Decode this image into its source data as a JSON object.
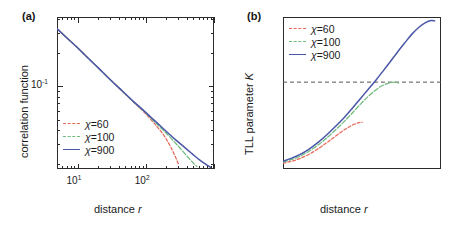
{
  "figure": {
    "panels": [
      {
        "letter": "(a)",
        "xlabel_prefix": "distance ",
        "xlabel_var": "r",
        "ylabel": "correlation function",
        "x_ticklabels": [
          {
            "mantissa": "10",
            "exponent": "1",
            "xval": 10
          },
          {
            "mantissa": "10",
            "exponent": "2",
            "xval": 100
          }
        ],
        "y_ticklabels": [
          {
            "mantissa": "10",
            "exponent": "-1",
            "yval": 0.1
          }
        ],
        "legend": [
          {
            "label_prefix": "χ",
            "label_rest": "=60",
            "color": "#e8685a",
            "dash": "3,2.2"
          },
          {
            "label_prefix": "χ",
            "label_rest": "=100",
            "color": "#6fba7d",
            "dash": "5,2.2"
          },
          {
            "label_prefix": "χ",
            "label_rest": "=900",
            "color": "#4a56a8",
            "dash": "none"
          }
        ]
      },
      {
        "letter": "(b)",
        "xlabel_prefix": "distance ",
        "xlabel_var": "r",
        "ylabel_prefix": "TLL parameter ",
        "ylabel_var": "K",
        "x_ticklabels": [
          {
            "mantissa": "10",
            "exponent": "1",
            "xval": 10
          },
          {
            "mantissa": "10",
            "exponent": "2",
            "xval": 100
          }
        ],
        "y_ticklabels": [
          {
            "text": "1.8",
            "yval": 1.8
          },
          {
            "text": "1.9",
            "yval": 1.9
          },
          {
            "text": "2.0",
            "yval": 2.0
          },
          {
            "text": "2.1",
            "yval": 2.1
          }
        ],
        "reference_line": {
          "value": 2.0,
          "color": "#555555",
          "dash": "4,3"
        },
        "legend": [
          {
            "label_prefix": "χ",
            "label_rest": "=60",
            "color": "#e8685a",
            "dash": "3,2.2"
          },
          {
            "label_prefix": "χ",
            "label_rest": "=100",
            "color": "#6fba7d",
            "dash": "5,2.2"
          },
          {
            "label_prefix": "χ",
            "label_rest": "=900",
            "color": "#4a56a8",
            "dash": "none"
          }
        ]
      }
    ]
  },
  "chart_data": [
    {
      "id": "panel-a",
      "type": "line",
      "title": "(a)",
      "xlabel": "distance r",
      "ylabel": "correlation function",
      "xscale": "log",
      "yscale": "log",
      "xlim": [
        5,
        1000
      ],
      "ylim": [
        0.018,
        0.42
      ],
      "grid": false,
      "legend_position": "lower-left",
      "series": [
        {
          "name": "χ=60",
          "color": "#e8685a",
          "style": "dashed",
          "x": [
            5,
            7,
            10,
            15,
            20,
            30,
            45,
            65,
            90,
            120,
            150,
            185,
            220,
            260,
            300
          ],
          "y": [
            0.33,
            0.272,
            0.222,
            0.174,
            0.147,
            0.115,
            0.0906,
            0.0727,
            0.0603,
            0.0498,
            0.0425,
            0.036,
            0.0302,
            0.0246,
            0.02
          ]
        },
        {
          "name": "χ=100",
          "color": "#6fba7d",
          "style": "dashed",
          "x": [
            5,
            7,
            10,
            15,
            20,
            30,
            45,
            65,
            90,
            120,
            160,
            210,
            270,
            340,
            420,
            500,
            560
          ],
          "y": [
            0.33,
            0.272,
            0.222,
            0.174,
            0.147,
            0.115,
            0.0908,
            0.0731,
            0.061,
            0.0514,
            0.0432,
            0.0366,
            0.031,
            0.0265,
            0.0228,
            0.0203,
            0.019
          ]
        },
        {
          "name": "χ=900",
          "color": "#4a56a8",
          "style": "solid",
          "x": [
            5,
            7,
            10,
            15,
            20,
            30,
            45,
            65,
            90,
            120,
            160,
            210,
            280,
            370,
            480,
            620,
            780,
            900
          ],
          "y": [
            0.33,
            0.272,
            0.222,
            0.174,
            0.147,
            0.1152,
            0.091,
            0.0735,
            0.0616,
            0.0524,
            0.0445,
            0.0382,
            0.0326,
            0.0282,
            0.0246,
            0.0216,
            0.0196,
            0.0186
          ]
        }
      ]
    },
    {
      "id": "panel-b",
      "type": "line",
      "title": "(b)",
      "xlabel": "distance r",
      "ylabel": "TLL parameter K",
      "xscale": "log",
      "yscale": "linear",
      "xlim": [
        3.6,
        200
      ],
      "ylim": [
        1.8,
        2.15
      ],
      "grid": false,
      "legend_position": "upper-left",
      "annotations": [
        {
          "type": "hline",
          "y": 2.0,
          "style": "dashed",
          "color": "#555555"
        }
      ],
      "series": [
        {
          "name": "χ=60",
          "color": "#e8685a",
          "style": "dashed",
          "x": [
            3.6,
            4.5,
            5.5,
            7,
            9,
            11,
            13,
            16,
            19,
            22,
            25,
            27
          ],
          "y": [
            1.813,
            1.818,
            1.824,
            1.834,
            1.848,
            1.861,
            1.872,
            1.886,
            1.896,
            1.903,
            1.907,
            1.908
          ]
        },
        {
          "name": "χ=100",
          "color": "#6fba7d",
          "style": "dashed",
          "x": [
            3.6,
            4.5,
            5.5,
            7,
            9,
            11,
            14,
            17,
            21,
            26,
            31,
            37,
            44,
            50,
            56,
            62,
            68
          ],
          "y": [
            1.816,
            1.822,
            1.829,
            1.841,
            1.857,
            1.872,
            1.892,
            1.909,
            1.929,
            1.95,
            1.966,
            1.98,
            1.991,
            1.996,
            1.999,
            2.0,
            1.998
          ]
        },
        {
          "name": "χ=900",
          "color": "#4a56a8",
          "style": "solid",
          "x": [
            3.6,
            4.5,
            5.5,
            7,
            9,
            11,
            14,
            17,
            21,
            26,
            31,
            38,
            46,
            55,
            66,
            80,
            95,
            115,
            135,
            155,
            170
          ],
          "y": [
            1.818,
            1.825,
            1.833,
            1.846,
            1.863,
            1.879,
            1.9,
            1.918,
            1.94,
            1.963,
            1.982,
            2.004,
            2.026,
            2.047,
            2.069,
            2.091,
            2.11,
            2.127,
            2.137,
            2.142,
            2.141
          ]
        }
      ]
    }
  ]
}
